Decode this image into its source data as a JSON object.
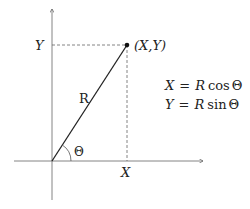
{
  "diagram": {
    "point_label": "(X,Y)",
    "y_label": "Y",
    "x_label": "X",
    "radius_label": "R",
    "angle_label": "Θ",
    "equations": [
      "X = R cos Θ",
      "Y = R sin Θ"
    ],
    "eq1": {
      "lhs": "X",
      "eq": "=",
      "r": "R",
      "fn": "cos",
      "ang": "Θ"
    },
    "eq2": {
      "lhs": "Y",
      "eq": "=",
      "r": "R",
      "fn": "sin",
      "ang": "Θ"
    },
    "colors": {
      "line": "#222222",
      "axis": "#555555",
      "dashed": "#555555"
    }
  }
}
